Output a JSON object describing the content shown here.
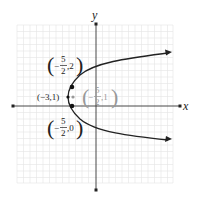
{
  "diagram": {
    "type": "parabola-graph",
    "axes": {
      "x_label": "x",
      "y_label": "y"
    },
    "curve": {
      "description": "Horizontal parabola opening right, vertex (-3,1), arrows on both ends",
      "color": "#222222"
    },
    "points": [
      {
        "name": "vertex",
        "label": "(−3,1)",
        "color": "#111111"
      },
      {
        "name": "upper",
        "label_sign": "−",
        "label_num": "5",
        "label_den": "2",
        "label_y": ",2",
        "color": "#111111"
      },
      {
        "name": "lower",
        "label_sign": "−",
        "label_num": "5",
        "label_den": "2",
        "label_y": ",0",
        "color": "#111111"
      },
      {
        "name": "focus",
        "label_sign": "−",
        "label_num": "5",
        "label_den": "2",
        "label_y": ",1",
        "color": "#999999"
      }
    ],
    "colors": {
      "grid": "#e4e4e4",
      "axis": "#333333",
      "focus_label": "#999999"
    }
  }
}
